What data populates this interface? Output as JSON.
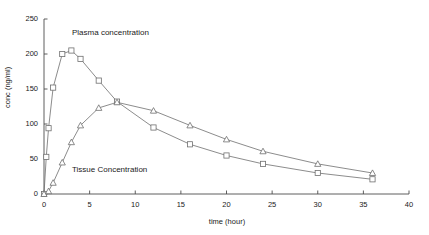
{
  "chart_data": {
    "type": "line",
    "title": "",
    "xlabel": "time (hour)",
    "ylabel": "conc (ng/ml)",
    "xlim": [
      0,
      40
    ],
    "ylim": [
      0,
      250
    ],
    "xticks": [
      0,
      5,
      10,
      15,
      20,
      25,
      30,
      35,
      40
    ],
    "yticks": [
      0,
      50,
      100,
      150,
      200,
      250
    ],
    "grid": false,
    "legend_position": "inline-annotations",
    "annotations": [
      {
        "text": "Plasma concentration",
        "x": 3.5,
        "y": 228
      },
      {
        "text": "Tissue Concentration",
        "x": 3.5,
        "y": 48
      }
    ],
    "series": [
      {
        "name": "Plasma concentration",
        "marker": "square",
        "color": "#6f6f6f",
        "x": [
          0,
          0.25,
          0.5,
          1,
          2,
          3,
          4,
          6,
          8,
          12,
          16,
          20,
          24,
          30,
          36
        ],
        "values": [
          0,
          53,
          94,
          152,
          200,
          205,
          193,
          162,
          132,
          95,
          71,
          55,
          43,
          30,
          21
        ]
      },
      {
        "name": "Tissue Concentration",
        "marker": "triangle",
        "color": "#6f6f6f",
        "x": [
          0,
          0.5,
          1,
          2,
          3,
          4,
          6,
          8,
          12,
          16,
          20,
          24,
          30,
          36
        ],
        "values": [
          0,
          4,
          16,
          45,
          74,
          98,
          123,
          131,
          119,
          98,
          78,
          61,
          43,
          30
        ]
      }
    ]
  },
  "axes": {
    "x_tick_labels": [
      "0",
      "5",
      "10",
      "15",
      "20",
      "25",
      "30",
      "35",
      "40"
    ],
    "y_tick_labels": [
      "0",
      "50",
      "100",
      "150",
      "200",
      "250"
    ],
    "x_title": "time (hour)",
    "y_title": "conc (ng/ml)"
  },
  "colors": {
    "axis": "#4d4d4d",
    "line": "#6f6f6f",
    "marker_stroke": "#5a5a5a",
    "marker_fill": "#ffffff",
    "text": "#1a1a1a",
    "background": "#ffffff"
  },
  "annotations": {
    "plasma_label": "Plasma concentration",
    "tissue_label": "Tissue Concentration"
  }
}
